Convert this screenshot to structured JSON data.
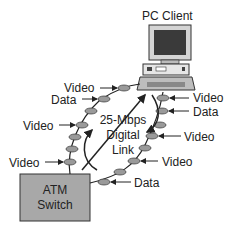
{
  "diagram": {
    "pc_client": {
      "label": "PC Client"
    },
    "atm_switch": {
      "line1": "ATM",
      "line2": "Switch"
    },
    "link": {
      "line1": "25-Mbps",
      "line2": "Digital",
      "line3": "Link"
    },
    "left_labels": [
      {
        "text": "Video"
      },
      {
        "text": "Data"
      },
      {
        "text": "Video"
      },
      {
        "text": "Video"
      }
    ],
    "right_labels": [
      {
        "text": "Video"
      },
      {
        "text": "Data"
      },
      {
        "text": "Video"
      },
      {
        "text": "Video"
      },
      {
        "text": "Data"
      }
    ],
    "colors": {
      "switch_fill": "#a8a8a8",
      "cell_fill": "#9a9a9a",
      "line": "#222222",
      "monitor_screen": "#3a3a3a"
    }
  }
}
